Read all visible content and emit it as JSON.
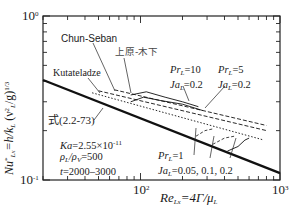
{
  "chart_data": {
    "type": "line",
    "title": "",
    "xlabel": "Re_Lx = 4Γ/μ_L",
    "ylabel": "Nu*_Lx = h/k_L (ν_L²/g)^(1/3)",
    "xscale": "log",
    "yscale": "log",
    "xlim": [
      20,
      1000
    ],
    "ylim": [
      0.1,
      1
    ],
    "x_tick_labels": [
      "10^2",
      "10^3"
    ],
    "y_tick_labels": [
      "10^-1",
      "10^0"
    ],
    "grid": false,
    "legend": "none (inline annotations)",
    "series": [
      {
        "name": "式(2.2-73)",
        "style": "solid-thick",
        "x": [
          20,
          1000
        ],
        "y": [
          0.407,
          0.11
        ]
      },
      {
        "name": "Kutateladze",
        "style": "dotted",
        "x": [
          45,
          750
        ],
        "y": [
          0.34,
          0.176
        ]
      },
      {
        "name": "Chun-Seban",
        "style": "dashed",
        "x": [
          50,
          800
        ],
        "y": [
          0.35,
          0.2
        ]
      },
      {
        "name": "上原-木下",
        "style": "dashed",
        "x": [
          65,
          800
        ],
        "y": [
          0.355,
          0.215
        ]
      },
      {
        "name": "Pr_L=10, Ja_L=0.2",
        "style": "solid-thin",
        "x": [
          85,
          110,
          150,
          200,
          260
        ],
        "y": [
          0.33,
          0.345,
          0.32,
          0.3,
          0.28
        ]
      },
      {
        "name": "Pr_L=5, Ja_L=0.2",
        "style": "solid-thin",
        "x": [
          85,
          105,
          140,
          200,
          280
        ],
        "y": [
          0.3,
          0.32,
          0.305,
          0.29,
          0.265
        ]
      },
      {
        "name": "Pr_L=1, Ja_L=0.05",
        "style": "dashed-thin",
        "x": [
          250,
          290,
          330
        ],
        "y": [
          0.185,
          0.2,
          0.205
        ]
      },
      {
        "name": "Pr_L=1, Ja_L=0.1",
        "style": "dashed-thin",
        "x": [
          330,
          400,
          470
        ],
        "y": [
          0.165,
          0.18,
          0.185
        ]
      },
      {
        "name": "Pr_L=1, Ja_L=0.2",
        "style": "solid-thin",
        "x": [
          420,
          500,
          560,
          600
        ],
        "y": [
          0.15,
          0.16,
          0.175,
          0.18
        ]
      }
    ],
    "annotations": [
      "Chun-Seban",
      "上原-木下",
      "Kutateladze",
      "式(2.2-73)",
      "Pr_L=10 Ja_L=0.2",
      "Pr_L=5 Ja_L=0.2",
      "Pr_L=1 Ja_L=0.05, 0.1, 0.2",
      "Ka=2.55×10^-11",
      "ρ_L/ρ_V=500",
      "t=2000-3000"
    ]
  },
  "labels": {
    "chun_seban": "Chun-Seban",
    "uehara": "上原-木下",
    "kutateladze": "Kutateladze",
    "eq": "式(2.2-73)",
    "pr10_pr": "Pr",
    "pr10_val": "=10",
    "pr10_ja": "Ja",
    "pr10_javal": "=0.2",
    "pr5_pr": "Pr",
    "pr5_val": "=5",
    "pr5_ja": "Ja",
    "pr5_javal": "=0.2",
    "pr1_pr": "Pr",
    "pr1_val": "=1",
    "pr1_ja": "Ja",
    "pr1_javal": "=0.05, 0.1, 0.2",
    "sub_L": "L",
    "ka": "Ka",
    "ka_val": "=2.55×10",
    "ka_exp": "-11",
    "rho_l": "ρ",
    "rho_sep": "/ρ",
    "rho_v_sub": "V",
    "rho_val": "=500",
    "t": "t",
    "t_val": "=2000–3000"
  },
  "axes": {
    "y_top": "10",
    "y_top_exp": "0",
    "y_bot": "10",
    "y_bot_exp": "-1",
    "x_mid": "10",
    "x_mid_exp": "2",
    "x_right": "10",
    "x_right_exp": "3",
    "xlabel_main": "Re",
    "xlabel_sub": "Lx",
    "xlabel_rest": "=4Γ/μ",
    "xlabel_sub2": "L",
    "ylabel_main": "Nu",
    "ylabel_star": "*",
    "ylabel_sub": "Lx",
    "ylabel_mid": "=h/k",
    "ylabel_sub2": "L",
    "ylabel_paren": " (ν",
    "ylabel_nu_sup": "2",
    "ylabel_nu_sub": "L",
    "ylabel_g": "/g)",
    "ylabel_exp": "1/3"
  }
}
